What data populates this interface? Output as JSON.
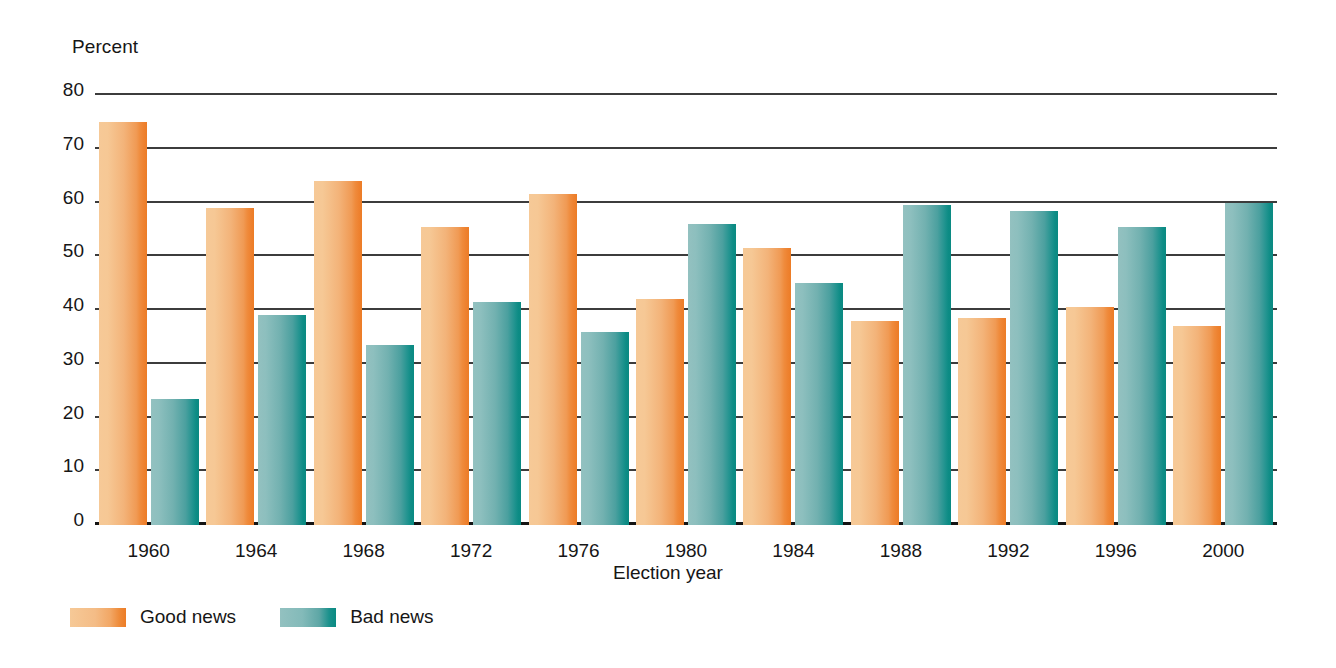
{
  "chart_data": {
    "type": "bar",
    "title": "",
    "subtitle": "",
    "xlabel": "Election year",
    "ylabel": "Percent",
    "ylim": [
      0,
      80
    ],
    "yticks": [
      80,
      70,
      60,
      50,
      40,
      30,
      20,
      10,
      0
    ],
    "grid": true,
    "legend_position": "bottom-left",
    "categories": [
      "1960",
      "1964",
      "1968",
      "1972",
      "1976",
      "1980",
      "1984",
      "1988",
      "1992",
      "1996",
      "2000"
    ],
    "series": [
      {
        "name": "Good news",
        "color": "#ee8b3a",
        "values": [
          75,
          59,
          64,
          55.5,
          61.5,
          42,
          51.5,
          38,
          38.5,
          40.5,
          37
        ]
      },
      {
        "name": "Bad news",
        "color": "#2e9694",
        "values": [
          23.5,
          39,
          33.5,
          41.5,
          36,
          56,
          45,
          59.5,
          58.5,
          55.5,
          60
        ]
      }
    ]
  },
  "axes": {
    "y_title": "Percent",
    "x_title": "Election year",
    "y_tick_labels": [
      "80",
      "70",
      "60",
      "50",
      "40",
      "30",
      "20",
      "10",
      "0"
    ],
    "x_tick_labels": [
      "1960",
      "1964",
      "1968",
      "1972",
      "1976",
      "1980",
      "1984",
      "1988",
      "1992",
      "1996",
      "2000"
    ]
  },
  "legend": {
    "items": [
      {
        "label": "Good news",
        "color": "#ee8b3a"
      },
      {
        "label": "Bad news",
        "color": "#2e9694"
      }
    ]
  }
}
